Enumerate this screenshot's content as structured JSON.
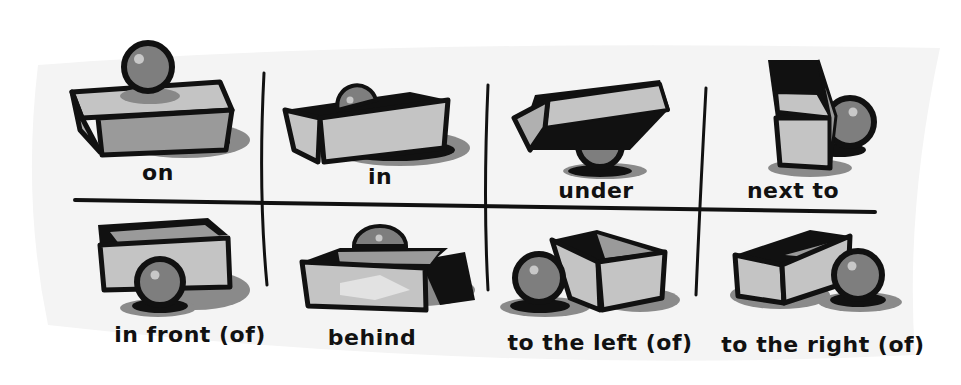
{
  "colors": {
    "page_bg": "#ffffff",
    "card_bg": "#f4f4f4",
    "outline": "#111111",
    "light_face": "#c4c4c4",
    "mid_face": "#9a9a9a",
    "shadow": "#8a8a8a",
    "ball": "#7e7e7e",
    "ball_highlight": "#c8c8c8"
  },
  "cells": [
    {
      "id": "on",
      "label": "on",
      "row": 1,
      "col": 1
    },
    {
      "id": "in",
      "label": "in",
      "row": 1,
      "col": 2
    },
    {
      "id": "under",
      "label": "under",
      "row": 1,
      "col": 3
    },
    {
      "id": "next-to",
      "label": "next to",
      "row": 1,
      "col": 4
    },
    {
      "id": "in-front-of",
      "label": "in front (of)",
      "row": 2,
      "col": 1
    },
    {
      "id": "behind",
      "label": "behind",
      "row": 2,
      "col": 2
    },
    {
      "id": "to-the-left-of",
      "label": "to the left (of)",
      "row": 2,
      "col": 3
    },
    {
      "id": "to-the-right-of",
      "label": "to the right (of)",
      "row": 2,
      "col": 4
    }
  ]
}
